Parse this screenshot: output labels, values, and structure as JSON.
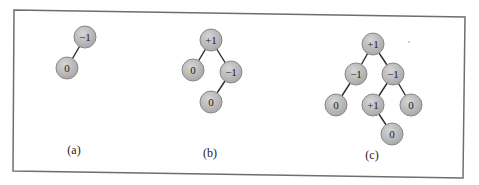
{
  "figure": {
    "frame": {
      "points": [
        [
          14,
          10
        ],
        [
          465,
          17
        ],
        [
          463,
          178
        ],
        [
          13,
          171
        ]
      ],
      "stroke": "#6e6e6e"
    },
    "colors": {
      "node_fill": "#a9a9a9",
      "node_highlight": "#d6d6d6",
      "node_stroke": "#8a8a8a",
      "edge": "#2a2a2a"
    },
    "node_radius": 11,
    "trees": [
      {
        "id": "a",
        "label": "(a)",
        "label_pos": [
          74,
          154
        ],
        "nodes": [
          {
            "id": "a1",
            "value": "−1",
            "x": 85,
            "y": 37
          },
          {
            "id": "a2",
            "value": "0",
            "x": 67,
            "y": 68
          }
        ],
        "edges": [
          [
            "a1",
            "a2"
          ]
        ]
      },
      {
        "id": "b",
        "label": "(b)",
        "label_pos": [
          210,
          157
        ],
        "nodes": [
          {
            "id": "b1",
            "value": "+1",
            "x": 211,
            "y": 40
          },
          {
            "id": "b2",
            "value": "0",
            "x": 193,
            "y": 70
          },
          {
            "id": "b3",
            "value": "−1",
            "x": 231,
            "y": 72
          },
          {
            "id": "b4",
            "value": "0",
            "x": 211,
            "y": 102
          }
        ],
        "edges": [
          [
            "b1",
            "b2"
          ],
          [
            "b1",
            "b3"
          ],
          [
            "b3",
            "b4"
          ]
        ]
      },
      {
        "id": "c",
        "label": "(c)",
        "label_pos": [
          372,
          159
        ],
        "nodes": [
          {
            "id": "c1",
            "value": "+1",
            "x": 373,
            "y": 44
          },
          {
            "id": "c2",
            "value": "−1",
            "x": 356,
            "y": 74
          },
          {
            "id": "c3",
            "value": "−1",
            "x": 393,
            "y": 74
          },
          {
            "id": "c4",
            "value": "0",
            "x": 336,
            "y": 105
          },
          {
            "id": "c5",
            "value": "+1",
            "x": 373,
            "y": 105
          },
          {
            "id": "c6",
            "value": "0",
            "x": 411,
            "y": 105
          },
          {
            "id": "c7",
            "value": "0",
            "x": 392,
            "y": 134
          }
        ],
        "edges": [
          [
            "c1",
            "c2"
          ],
          [
            "c1",
            "c3"
          ],
          [
            "c2",
            "c4"
          ],
          [
            "c3",
            "c5"
          ],
          [
            "c3",
            "c6"
          ],
          [
            "c5",
            "c7"
          ]
        ]
      }
    ]
  }
}
